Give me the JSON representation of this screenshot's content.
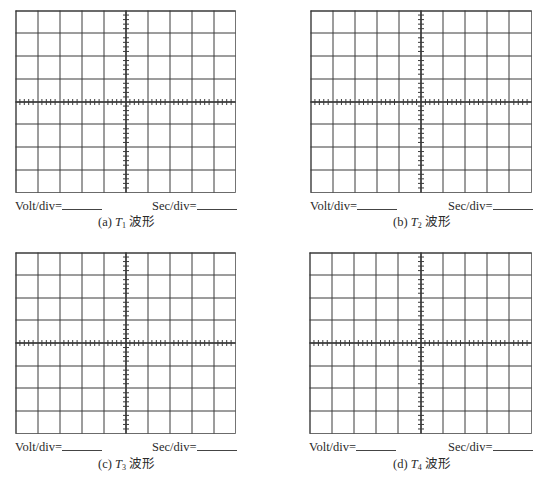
{
  "figure": {
    "grid": {
      "columns": 10,
      "rows": 8,
      "minor_ticks_per_division": 5,
      "line_color": "#3a3a3a",
      "background": "#ffffff"
    },
    "panels": [
      {
        "id": "a",
        "caption_prefix": "(a)",
        "var": "T",
        "sub": "1",
        "caption_suffix": "波形",
        "volt_label": "Volt/div=",
        "volt_value": "",
        "sec_label": "Sec/div=",
        "sec_value": ""
      },
      {
        "id": "b",
        "caption_prefix": "(b)",
        "var": "T",
        "sub": "2",
        "caption_suffix": "波形",
        "volt_label": "Volt/div=",
        "volt_value": "",
        "sec_label": "Sec/div=",
        "sec_value": ""
      },
      {
        "id": "c",
        "caption_prefix": "(c)",
        "var": "T",
        "sub": "3",
        "caption_suffix": "波形",
        "volt_label": "Volt/div=",
        "volt_value": "",
        "sec_label": "Sec/div=",
        "sec_value": ""
      },
      {
        "id": "d",
        "caption_prefix": "(d)",
        "var": "T",
        "sub": "4",
        "caption_suffix": "波形",
        "volt_label": "Volt/div=",
        "volt_value": "",
        "sec_label": "Sec/div=",
        "sec_value": ""
      }
    ]
  }
}
